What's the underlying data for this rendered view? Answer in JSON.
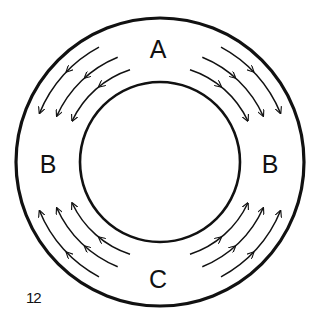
{
  "figure_number": "12",
  "labels": {
    "top": "A",
    "left": "B",
    "right": "B",
    "bottom": "C"
  },
  "geometry": {
    "center": [
      160,
      162
    ],
    "outer_radius": 144,
    "inner_radius": 80,
    "arrow_radii": [
      130,
      113,
      97
    ]
  },
  "flows": [
    {
      "quadrant": "upper-left",
      "from": "A",
      "to": "B",
      "direction": "downward-toward-left-B",
      "count": 3
    },
    {
      "quadrant": "upper-right",
      "from": "A",
      "to": "B",
      "direction": "downward-toward-right-B",
      "count": 3
    },
    {
      "quadrant": "lower-left",
      "from": "C",
      "to": "B",
      "direction": "upward-toward-left-B",
      "count": 3
    },
    {
      "quadrant": "lower-right",
      "from": "C",
      "to": "B",
      "direction": "upward-toward-right-B",
      "count": 3
    }
  ],
  "colors": {
    "stroke": "#111111",
    "background": "#ffffff"
  }
}
